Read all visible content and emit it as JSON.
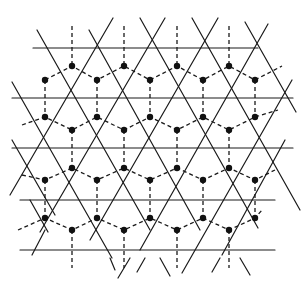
{
  "diagram": {
    "title": "",
    "colors": {
      "line": "#1a1a1a",
      "dot": "#111111",
      "background": "#ffffff"
    },
    "horizontal_lines": [
      {
        "y": 48,
        "x1": 33,
        "x2": 258
      },
      {
        "y": 98,
        "x1": 12,
        "x2": 293
      },
      {
        "y": 148,
        "x1": 12,
        "x2": 293
      },
      {
        "y": 200,
        "x1": 20,
        "x2": 275
      },
      {
        "y": 250,
        "x1": 20,
        "x2": 275
      }
    ],
    "diagonal_lines": [
      {
        "x1": 37,
        "y1": 30,
        "x2": 150,
        "y2": 230
      },
      {
        "x1": 89,
        "y1": 30,
        "x2": 200,
        "y2": 230
      },
      {
        "x1": 140,
        "y1": 18,
        "x2": 258,
        "y2": 228
      },
      {
        "x1": 192,
        "y1": 18,
        "x2": 300,
        "y2": 210
      },
      {
        "x1": 245,
        "y1": 22,
        "x2": 296,
        "y2": 112
      },
      {
        "x1": 12,
        "y1": 82,
        "x2": 112,
        "y2": 258
      },
      {
        "x1": 12,
        "y1": 140,
        "x2": 55,
        "y2": 215
      },
      {
        "x1": 30,
        "y1": 200,
        "x2": 48,
        "y2": 232
      },
      {
        "x1": 45,
        "y1": 230,
        "x2": 32,
        "y2": 255
      },
      {
        "x1": 113,
        "y1": 18,
        "x2": 10,
        "y2": 195
      },
      {
        "x1": 165,
        "y1": 18,
        "x2": 40,
        "y2": 232
      },
      {
        "x1": 218,
        "y1": 18,
        "x2": 90,
        "y2": 240
      },
      {
        "x1": 268,
        "y1": 24,
        "x2": 140,
        "y2": 250
      },
      {
        "x1": 292,
        "y1": 80,
        "x2": 182,
        "y2": 273
      },
      {
        "x1": 285,
        "y1": 140,
        "x2": 222,
        "y2": 255
      },
      {
        "x1": 130,
        "y1": 258,
        "x2": 118,
        "y2": 278
      },
      {
        "x1": 110,
        "y1": 258,
        "x2": 115,
        "y2": 270
      },
      {
        "x1": 160,
        "y1": 258,
        "x2": 170,
        "y2": 276
      },
      {
        "x1": 145,
        "y1": 258,
        "x2": 137,
        "y2": 272
      },
      {
        "x1": 240,
        "y1": 258,
        "x2": 250,
        "y2": 275
      },
      {
        "x1": 220,
        "y1": 258,
        "x2": 212,
        "y2": 272
      }
    ],
    "vertical_dashes": [
      {
        "x": 72,
        "y1": 26,
        "y2": 66
      },
      {
        "x": 124,
        "y1": 26,
        "y2": 66
      },
      {
        "x": 177,
        "y1": 26,
        "y2": 66
      },
      {
        "x": 229,
        "y1": 26,
        "y2": 66
      },
      {
        "x": 45,
        "y1": 80,
        "y2": 117
      },
      {
        "x": 97,
        "y1": 80,
        "y2": 117
      },
      {
        "x": 150,
        "y1": 80,
        "y2": 117
      },
      {
        "x": 203,
        "y1": 80,
        "y2": 117
      },
      {
        "x": 255,
        "y1": 80,
        "y2": 117
      },
      {
        "x": 72,
        "y1": 130,
        "y2": 168
      },
      {
        "x": 124,
        "y1": 130,
        "y2": 168
      },
      {
        "x": 177,
        "y1": 130,
        "y2": 168
      },
      {
        "x": 229,
        "y1": 130,
        "y2": 168
      },
      {
        "x": 45,
        "y1": 180,
        "y2": 218
      },
      {
        "x": 97,
        "y1": 180,
        "y2": 218
      },
      {
        "x": 150,
        "y1": 180,
        "y2": 218
      },
      {
        "x": 203,
        "y1": 180,
        "y2": 218
      },
      {
        "x": 255,
        "y1": 180,
        "y2": 218
      },
      {
        "x": 72,
        "y1": 230,
        "y2": 268
      },
      {
        "x": 124,
        "y1": 230,
        "y2": 268
      },
      {
        "x": 177,
        "y1": 230,
        "y2": 268
      },
      {
        "x": 229,
        "y1": 230,
        "y2": 268
      }
    ],
    "zigzag_dashes": [
      {
        "points": "45,80 72,66 97,80 124,66 150,80 177,66 203,80 229,66 255,80 282,66"
      },
      {
        "points": "22,125 45,117 72,130 97,117 124,130 150,117 177,130 203,117 229,130 255,117 278,110"
      },
      {
        "points": "22,175 45,180 72,168 97,180 124,168 150,180 177,168 203,180 229,168 255,180 275,170"
      },
      {
        "points": "18,230 45,218 72,230 97,218 124,230 150,218 177,230 203,218 229,230 255,218 262,210"
      }
    ],
    "dots": [
      [
        72,
        66
      ],
      [
        124,
        66
      ],
      [
        177,
        66
      ],
      [
        229,
        66
      ],
      [
        45,
        80
      ],
      [
        97,
        80
      ],
      [
        150,
        80
      ],
      [
        203,
        80
      ],
      [
        255,
        80
      ],
      [
        45,
        117
      ],
      [
        97,
        117
      ],
      [
        150,
        117
      ],
      [
        203,
        117
      ],
      [
        255,
        117
      ],
      [
        72,
        130
      ],
      [
        124,
        130
      ],
      [
        177,
        130
      ],
      [
        229,
        130
      ],
      [
        72,
        168
      ],
      [
        124,
        168
      ],
      [
        177,
        168
      ],
      [
        229,
        168
      ],
      [
        45,
        180
      ],
      [
        97,
        180
      ],
      [
        150,
        180
      ],
      [
        203,
        180
      ],
      [
        255,
        180
      ],
      [
        45,
        218
      ],
      [
        97,
        218
      ],
      [
        150,
        218
      ],
      [
        203,
        218
      ],
      [
        255,
        218
      ],
      [
        72,
        230
      ],
      [
        124,
        230
      ],
      [
        177,
        230
      ],
      [
        229,
        230
      ]
    ]
  }
}
